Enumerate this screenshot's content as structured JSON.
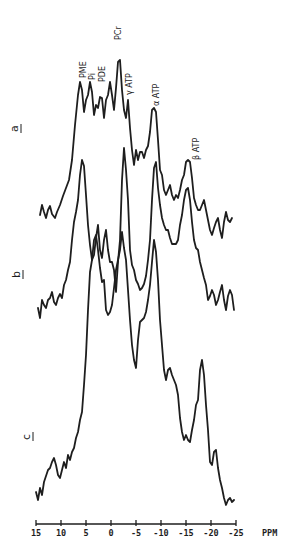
{
  "figure": {
    "type": "31P NMR spectra (stacked)",
    "traces": [
      {
        "label": "a"
      },
      {
        "label": "b"
      },
      {
        "label": "c"
      }
    ],
    "peak_labels": [
      {
        "text": "PME"
      },
      {
        "text": "Pi"
      },
      {
        "text": "PDE"
      },
      {
        "text": "PCr"
      },
      {
        "text": "γ ATP"
      },
      {
        "text": "α ATP"
      },
      {
        "text": "β ATP"
      }
    ],
    "axis": {
      "unit": "PPM",
      "ticks": [
        "15",
        "10",
        "5",
        "0",
        "-5",
        "-10",
        "-15",
        "-20",
        "-25"
      ]
    }
  }
}
